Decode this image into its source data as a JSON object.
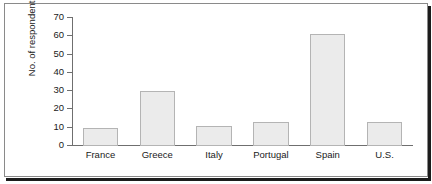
{
  "figure": {
    "background_color": "#ffffff",
    "frame_color": "#8a8a8a",
    "shadow_color": "#1c1c1c"
  },
  "chart_data": {
    "type": "bar",
    "title": "",
    "subtitle": "",
    "xlabel": "",
    "ylabel": "No. of respondents",
    "categories": [
      "France",
      "Greece",
      "Italy",
      "Portugal",
      "Spain",
      "U.S."
    ],
    "values": [
      10,
      30,
      11,
      13,
      61,
      13
    ],
    "series": [
      {
        "name": "No. of respondents",
        "values": [
          10,
          30,
          11,
          13,
          61,
          13
        ]
      }
    ],
    "ylim": [
      0,
      70
    ],
    "ytick_step": 10,
    "yticks": [
      0,
      10,
      20,
      30,
      40,
      50,
      60,
      70
    ],
    "ytick_labels": [
      "0",
      "10",
      "20",
      "30",
      "40",
      "50",
      "60",
      "70"
    ],
    "grid": false,
    "legend": false,
    "legend_position": "none",
    "annotations": [],
    "bar_fill_color": "#ebebeb",
    "bar_edge_color": "#b4b4b4",
    "axis_color": "#6f6f6f",
    "text_color": "#1a1a1a"
  }
}
